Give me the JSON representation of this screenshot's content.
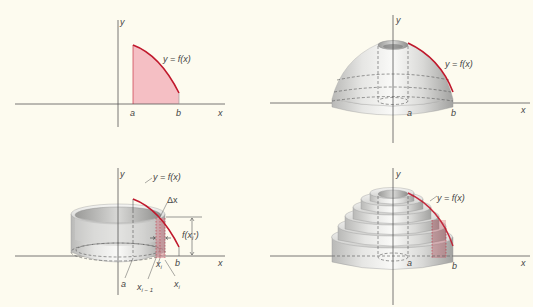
{
  "figure": {
    "colors": {
      "background": "#fdfbef",
      "axis": "#555555",
      "curve": "#c0182c",
      "region_fill": "#f4b8bf",
      "solid_light": "#f0f0ee",
      "solid_dark": "#a8a8a6",
      "label": "#444444"
    },
    "panels": [
      {
        "id": "top-left",
        "title": "Region under curve",
        "labels": {
          "y_axis": "y",
          "x_axis": "x",
          "curve": "y = f(x)",
          "a": "a",
          "b": "b"
        }
      },
      {
        "id": "top-right",
        "title": "Solid of revolution",
        "labels": {
          "y_axis": "y",
          "x_axis": "x",
          "curve": "y = f(x)",
          "a": "a",
          "b": "b"
        }
      },
      {
        "id": "bottom-left",
        "title": "Single cylindrical shell",
        "labels": {
          "y_axis": "y",
          "x_axis": "x",
          "curve": "y = f(x)",
          "delta_x": "Δx",
          "height_main": "f(x",
          "height_sub": "i",
          "height_sup": "*",
          "height_close": ")",
          "a": "a",
          "b": "b",
          "xi_star_main": "x",
          "xi_star_sub": "i",
          "xi_minus_main": "x",
          "xi_minus_sub": "i − 1",
          "xi_main": "x",
          "xi_sub": "i"
        }
      },
      {
        "id": "bottom-right",
        "title": "Approximation by shells",
        "labels": {
          "y_axis": "y",
          "x_axis": "x",
          "curve": "y = f(x)",
          "a": "a",
          "b": "b"
        }
      }
    ]
  }
}
